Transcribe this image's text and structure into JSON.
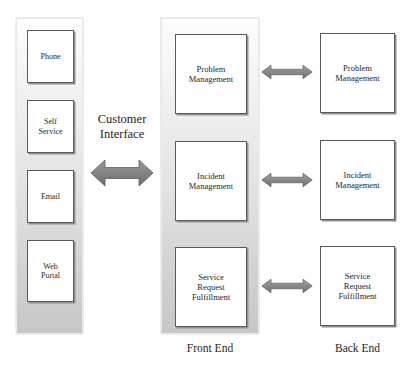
{
  "diagram": {
    "background_color": "#ffffff",
    "arrow_color": "#7a7a7a",
    "box_border_color": "#5a5a5a",
    "panel_gradient_top": "#fdfdfd",
    "panel_gradient_bottom": "#c7c7c7"
  },
  "channels": {
    "panel_name": "customer-channels-panel",
    "items": [
      {
        "label": "Phone"
      },
      {
        "label": "Self\nService"
      },
      {
        "label": "Email"
      },
      {
        "label": "Web\nPortal"
      }
    ]
  },
  "customer_interface": {
    "label": "Customer\nInterface",
    "arrow": "double-headed-horizontal-arrow"
  },
  "front_end": {
    "caption": "Front End",
    "processes": [
      {
        "label": "Problem\nManagement"
      },
      {
        "label": "Incident\nManagement"
      },
      {
        "label": "Service\nRequest\nFulfillment"
      }
    ]
  },
  "back_end": {
    "caption": "Back End",
    "processes": [
      {
        "label": "Problem\nManagement"
      },
      {
        "label": "Incident\nManagement"
      },
      {
        "label": "Service\nRequest\nFulfillment"
      }
    ]
  },
  "connectors": [
    {
      "name": "problem-management-link",
      "from": "front_end.processes.0",
      "to": "back_end.processes.0",
      "type": "double-headed-horizontal-arrow"
    },
    {
      "name": "incident-management-link",
      "from": "front_end.processes.1",
      "to": "back_end.processes.1",
      "type": "double-headed-horizontal-arrow"
    },
    {
      "name": "service-request-link",
      "from": "front_end.processes.2",
      "to": "back_end.processes.2",
      "type": "double-headed-horizontal-arrow"
    }
  ]
}
